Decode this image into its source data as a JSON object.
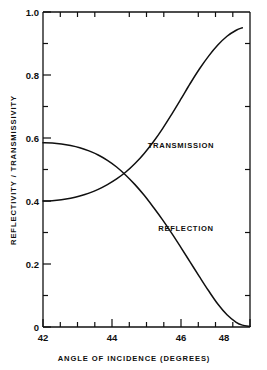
{
  "chart_data": {
    "type": "line",
    "title": "",
    "xlabel": "ANGLE OF INCIDENCE  (DEGREES)",
    "ylabel": "REFLECTIVITY / TRANSMISSIVITY",
    "xlim": [
      42,
      48.75
    ],
    "ylim": [
      0,
      1.0
    ],
    "grid": false,
    "legend_position": "inline-annotations",
    "x_ticks": [
      42,
      44,
      46,
      48
    ],
    "x_tick_labels": [
      "42",
      "44",
      "46",
      "48"
    ],
    "x_minor_step": 0.5,
    "y_ticks": [
      0,
      0.2,
      0.4,
      0.6,
      0.8,
      1.0
    ],
    "y_tick_labels": [
      "0",
      "0.2",
      "0.4",
      "0.6",
      "0.8",
      "1.0"
    ],
    "y_minor_step": 0.1,
    "annotations": [
      {
        "text": "TRANSMISSION",
        "x": 45.95,
        "y": 0.545
      },
      {
        "text": "REFLECTION",
        "x": 46.1,
        "y": 0.275
      }
    ],
    "series": [
      {
        "name": "TRANSMISSION",
        "color": "#101010",
        "x": [
          42.0,
          42.3,
          42.6,
          42.9,
          43.2,
          43.5,
          43.8,
          44.1,
          44.4,
          44.7,
          45.0,
          45.3,
          45.6,
          45.9,
          46.2,
          46.5,
          46.8,
          47.1,
          47.4,
          47.7,
          48.0,
          48.3,
          48.5
        ],
        "y": [
          0.4,
          0.401,
          0.404,
          0.409,
          0.416,
          0.425,
          0.437,
          0.452,
          0.47,
          0.492,
          0.519,
          0.551,
          0.588,
          0.63,
          0.676,
          0.724,
          0.773,
          0.819,
          0.86,
          0.895,
          0.923,
          0.942,
          0.95
        ]
      },
      {
        "name": "REFLECTION",
        "color": "#101010",
        "x": [
          42.0,
          42.3,
          42.6,
          42.9,
          43.2,
          43.5,
          43.8,
          44.1,
          44.4,
          44.7,
          45.0,
          45.3,
          45.6,
          45.9,
          46.2,
          46.5,
          46.8,
          47.1,
          47.4,
          47.7,
          48.0,
          48.3,
          48.5,
          48.75
        ],
        "y": [
          0.585,
          0.584,
          0.581,
          0.576,
          0.569,
          0.559,
          0.546,
          0.529,
          0.508,
          0.482,
          0.452,
          0.418,
          0.38,
          0.34,
          0.297,
          0.252,
          0.206,
          0.16,
          0.115,
          0.073,
          0.039,
          0.015,
          0.006,
          0.002
        ]
      }
    ],
    "crossing_point": {
      "x": 44.6,
      "y": 0.478
    }
  },
  "figure": {
    "caption_x": "ANGLE OF INCIDENCE  (DEGREES)",
    "caption_y": "REFLECTIVITY / TRANSMISSIVITY"
  }
}
